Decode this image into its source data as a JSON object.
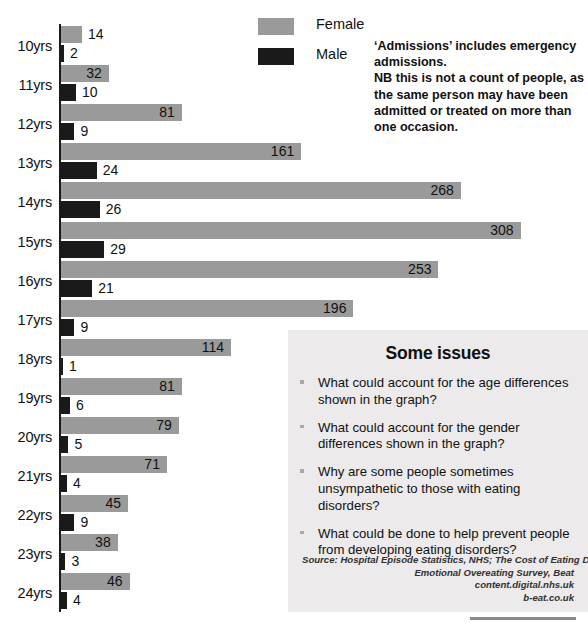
{
  "chart_data": {
    "type": "bar",
    "orientation": "horizontal",
    "title": "",
    "xlabel": "",
    "ylabel": "",
    "categories": [
      "10yrs",
      "11yrs",
      "12yrs",
      "13yrs",
      "14yrs",
      "15yrs",
      "16yrs",
      "17yrs",
      "18yrs",
      "19yrs",
      "20yrs",
      "21yrs",
      "22yrs",
      "23yrs",
      "24yrs"
    ],
    "series": [
      {
        "name": "Female",
        "color": "#9a9a9a",
        "values": [
          14,
          32,
          81,
          161,
          268,
          308,
          253,
          196,
          114,
          81,
          79,
          71,
          45,
          38,
          46
        ]
      },
      {
        "name": "Male",
        "color": "#1a1a1a",
        "values": [
          2,
          10,
          9,
          24,
          26,
          29,
          21,
          9,
          1,
          6,
          5,
          4,
          9,
          3,
          4
        ]
      }
    ],
    "xlim": [
      0,
      308
    ],
    "grid": false,
    "legend_position": "top-center",
    "value_labels": true
  },
  "legend": {
    "items": [
      {
        "label": "Female",
        "color": "#9a9a9a",
        "swatch": "female-swatch"
      },
      {
        "label": "Male",
        "color": "#1a1a1a",
        "swatch": "male-swatch"
      }
    ]
  },
  "note": {
    "lines": [
      "‘Admissions’ includes emergency",
      "admissions.",
      "NB this is not a count of people, as",
      "the same person may have been",
      "admitted or treated on more than",
      "one occasion."
    ]
  },
  "issues_panel": {
    "title": "Some issues",
    "background": "#eceaea",
    "bullets": [
      {
        "lines": [
          "What could account for the age differences",
          "shown in the graph?"
        ]
      },
      {
        "lines": [
          "What could account for the gender",
          "differences shown in the graph?"
        ]
      },
      {
        "lines": [
          "Why are some people sometimes",
          "unsympathetic to those with eating",
          "disorders?"
        ]
      },
      {
        "lines": [
          "What could be done to help prevent people",
          "from developing eating disorders?"
        ]
      }
    ],
    "source": [
      "Source: Hospital Episode Statistics, NHS; The Cost of Eating Disorders &",
      "Emotional Overeating Survey, Beat",
      "content.digital.nhs.uk",
      "b-eat.co.uk"
    ]
  }
}
